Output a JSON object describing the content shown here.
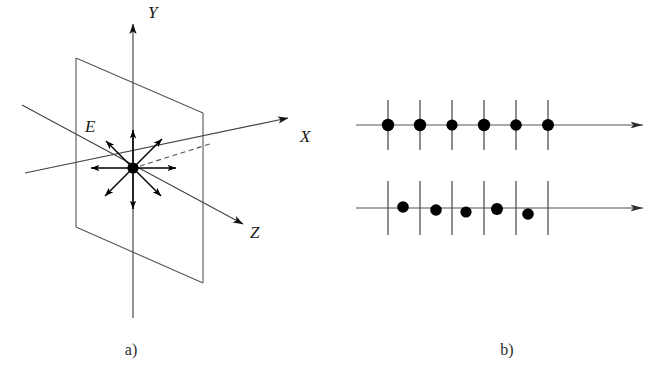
{
  "figure": {
    "background_color": "#ffffff",
    "line_color": "#555555",
    "marker_color": "#000000",
    "panels": [
      {
        "id": "a",
        "caption": "a)",
        "caption_x": 131,
        "caption_y": 355
      },
      {
        "id": "b",
        "caption": "b)",
        "caption_y": 355
      }
    ]
  },
  "panel_a": {
    "caption": "a)",
    "axes": [
      {
        "name": "Y",
        "label": "Y",
        "label_x": 148,
        "label_y": 18,
        "arrow": "up"
      },
      {
        "name": "X",
        "label": "X",
        "label_x": 300,
        "label_y": 142,
        "arrow": "up-right"
      },
      {
        "name": "Z",
        "label": "Z",
        "label_x": 250,
        "label_y": 238,
        "arrow": "down-right"
      }
    ],
    "field_label": "E",
    "field_label_x": 85,
    "field_label_y": 132,
    "origin": {
      "x": 133,
      "y": 168
    },
    "plane": {
      "name": "xy-plane-parallelogram",
      "corners": [
        [
          76,
          58
        ],
        [
          203,
          113
        ],
        [
          203,
          283
        ],
        [
          76,
          227
        ]
      ]
    },
    "field_arrow_count": 8,
    "field_arrow_angles_deg": [
      90,
      45,
      0,
      -45,
      -90,
      -135,
      180,
      135
    ]
  },
  "panel_b": {
    "caption": "b)",
    "rows": [
      {
        "name": "aligned-row",
        "description": "dots centered on ticks",
        "axis_y": 125,
        "axis_x_start": 16,
        "axis_x_end": 303,
        "tick_half_height": 25,
        "tick_positions": [
          48,
          80,
          112,
          144,
          176,
          208
        ],
        "dots": [
          {
            "x": 48,
            "y": 125,
            "r": 6.2
          },
          {
            "x": 80,
            "y": 125,
            "r": 6.2
          },
          {
            "x": 112,
            "y": 125,
            "r": 5.6
          },
          {
            "x": 144,
            "y": 125,
            "r": 6.2
          },
          {
            "x": 176,
            "y": 125,
            "r": 5.8
          },
          {
            "x": 208,
            "y": 125,
            "r": 6.0
          }
        ]
      },
      {
        "name": "offset-row",
        "description": "dots displaced from ticks",
        "axis_y": 208,
        "axis_x_start": 16,
        "axis_x_end": 303,
        "tick_half_height": 27,
        "tick_positions": [
          48,
          80,
          112,
          144,
          176,
          208
        ],
        "dots": [
          {
            "x": 63,
            "y": 207,
            "r": 5.8
          },
          {
            "x": 96,
            "y": 210,
            "r": 5.8
          },
          {
            "x": 126,
            "y": 212,
            "r": 5.6
          },
          {
            "x": 157,
            "y": 209,
            "r": 6.0
          },
          {
            "x": 188,
            "y": 214,
            "r": 5.8
          }
        ]
      }
    ]
  }
}
